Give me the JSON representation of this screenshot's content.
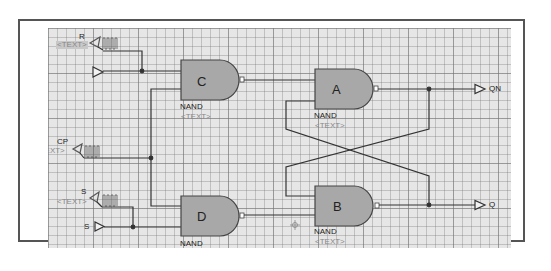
{
  "diagram": {
    "title": "",
    "colors": {
      "grid_background": "#e6e6e6",
      "gate_fill": "#a8a8a8",
      "wire": "#333333",
      "frame": "#555555",
      "placeholder_text": "#888888"
    },
    "inputs": [
      {
        "id": "R",
        "label": "R",
        "text_placeholder": "<TEXT>",
        "has_clock_source": true
      },
      {
        "id": "CP",
        "label": "CP",
        "text_placeholder": "<TEXT>",
        "has_clock_source": true
      },
      {
        "id": "S",
        "label": "S",
        "text_placeholder": "<TEXT>",
        "has_clock_source": true
      },
      {
        "id": "S_port",
        "label": "S"
      }
    ],
    "gates": [
      {
        "id": "C",
        "name": "C",
        "type": "NAND",
        "text_placeholder": "<TEXT>"
      },
      {
        "id": "A",
        "name": "A",
        "type": "NAND",
        "text_placeholder": "<TEXT>"
      },
      {
        "id": "D",
        "name": "D",
        "type": "NAND",
        "text_placeholder": ""
      },
      {
        "id": "B",
        "name": "B",
        "type": "NAND",
        "text_placeholder": "<TEXT>"
      }
    ],
    "outputs": [
      {
        "id": "QN",
        "label": "QN"
      },
      {
        "id": "Q",
        "label": "Q"
      }
    ],
    "cursor_icon": "move-crosshair-icon"
  }
}
